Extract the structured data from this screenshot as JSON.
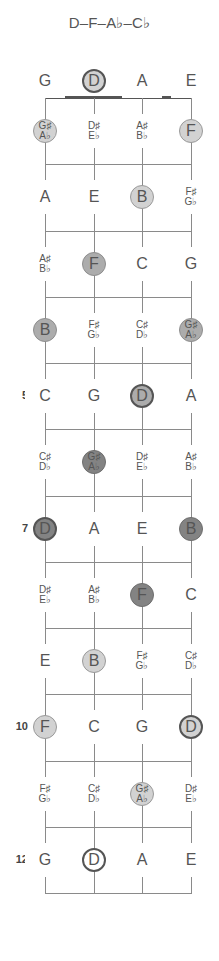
{
  "title": "D–F–A♭–C♭",
  "strings": [
    "G",
    "D",
    "A",
    "E"
  ],
  "string_x": [
    45,
    94,
    142,
    191
  ],
  "fret_numbers": [
    {
      "fret": 5,
      "label": "5"
    },
    {
      "fret": 7,
      "label": "7"
    },
    {
      "fret": 10,
      "label": "10"
    },
    {
      "fret": 12,
      "label": "12"
    }
  ],
  "rows": [
    {
      "fret": 0,
      "cells": [
        {
          "text": "G"
        },
        {
          "text": "D",
          "shade": "light",
          "root": true
        },
        {
          "text": "A"
        },
        {
          "text": "E"
        }
      ]
    },
    {
      "fret": 1,
      "cells": [
        {
          "sharp": "G♯",
          "flat": "A♭",
          "shade": "light"
        },
        {
          "sharp": "D♯",
          "flat": "E♭"
        },
        {
          "sharp": "A♯",
          "flat": "B♭"
        },
        {
          "text": "F",
          "shade": "light"
        }
      ]
    },
    {
      "fret": 2,
      "cells": [
        {
          "text": "A"
        },
        {
          "text": "E"
        },
        {
          "text": "B",
          "shade": "light"
        },
        {
          "sharp": "F♯",
          "flat": "G♭"
        }
      ]
    },
    {
      "fret": 3,
      "cells": [
        {
          "sharp": "A♯",
          "flat": "B♭"
        },
        {
          "text": "F",
          "shade": "medium"
        },
        {
          "text": "C"
        },
        {
          "text": "G"
        }
      ]
    },
    {
      "fret": 4,
      "cells": [
        {
          "text": "B",
          "shade": "medium"
        },
        {
          "sharp": "F♯",
          "flat": "G♭"
        },
        {
          "sharp": "C♯",
          "flat": "D♭"
        },
        {
          "sharp": "G♯",
          "flat": "A♭",
          "shade": "medium"
        }
      ]
    },
    {
      "fret": 5,
      "cells": [
        {
          "text": "C"
        },
        {
          "text": "G"
        },
        {
          "text": "D",
          "shade": "medium",
          "root": true
        },
        {
          "text": "A"
        }
      ]
    },
    {
      "fret": 6,
      "cells": [
        {
          "sharp": "C♯",
          "flat": "D♭"
        },
        {
          "sharp": "G♯",
          "flat": "A♭",
          "shade": "dark"
        },
        {
          "sharp": "D♯",
          "flat": "E♭"
        },
        {
          "sharp": "A♯",
          "flat": "B♭"
        }
      ]
    },
    {
      "fret": 7,
      "cells": [
        {
          "text": "D",
          "shade": "dark",
          "root": true
        },
        {
          "text": "A"
        },
        {
          "text": "E"
        },
        {
          "text": "B",
          "shade": "dark"
        }
      ]
    },
    {
      "fret": 8,
      "cells": [
        {
          "sharp": "D♯",
          "flat": "E♭"
        },
        {
          "sharp": "A♯",
          "flat": "B♭"
        },
        {
          "text": "F",
          "shade": "dark"
        },
        {
          "text": "C"
        }
      ]
    },
    {
      "fret": 9,
      "cells": [
        {
          "text": "E"
        },
        {
          "text": "B",
          "shade": "light"
        },
        {
          "sharp": "F♯",
          "flat": "G♭"
        },
        {
          "sharp": "C♯",
          "flat": "D♭"
        }
      ]
    },
    {
      "fret": 10,
      "cells": [
        {
          "text": "F",
          "shade": "light"
        },
        {
          "text": "C"
        },
        {
          "text": "G"
        },
        {
          "text": "D",
          "shade": "light",
          "root": true
        }
      ]
    },
    {
      "fret": 11,
      "cells": [
        {
          "sharp": "F♯",
          "flat": "G♭"
        },
        {
          "sharp": "C♯",
          "flat": "D♭"
        },
        {
          "sharp": "G♯",
          "flat": "A♭",
          "shade": "light"
        },
        {
          "sharp": "D♯",
          "flat": "E♭"
        }
      ]
    },
    {
      "fret": 12,
      "cells": [
        {
          "text": "G"
        },
        {
          "text": "D",
          "shade": "white",
          "root": true
        },
        {
          "text": "A"
        },
        {
          "text": "E"
        }
      ]
    }
  ],
  "colors": {
    "light": "#d2d2d2",
    "medium": "#acacac",
    "dark": "#838383",
    "line": "#8a8a8a",
    "nut": "#555555"
  }
}
